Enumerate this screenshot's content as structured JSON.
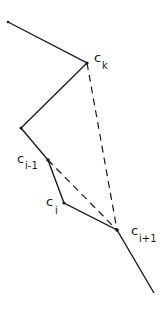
{
  "diagram": {
    "type": "polygonal-chain",
    "stroke_color": "#1a1a1a",
    "background": "#ffffff",
    "vertices": [
      {
        "id": "start",
        "x": 8,
        "y": 22,
        "label": ""
      },
      {
        "id": "ck",
        "x": 87,
        "y": 63,
        "label": "c",
        "subscript": "k"
      },
      {
        "id": "v",
        "x": 21,
        "y": 128,
        "label": ""
      },
      {
        "id": "ci-1",
        "x": 48,
        "y": 160,
        "label": "c",
        "subscript": "i-1"
      },
      {
        "id": "ci",
        "x": 64,
        "y": 203,
        "label": "c",
        "subscript": "i"
      },
      {
        "id": "ci+1",
        "x": 117,
        "y": 230,
        "label": "c",
        "subscript": "i+1"
      },
      {
        "id": "end",
        "x": 154,
        "y": 293,
        "label": ""
      }
    ],
    "solid_path": [
      "start",
      "ck",
      "v",
      "ci-1",
      "ci",
      "ci+1",
      "end"
    ],
    "dashed_segments": [
      {
        "from": "ck",
        "to": "ci+1"
      },
      {
        "from": "ci-1",
        "to": "ci+1"
      }
    ],
    "labels": {
      "ck": {
        "main": "c",
        "sub": "k"
      },
      "ci_minus_1": {
        "main": "c",
        "sub": "i-1"
      },
      "ci": {
        "main": "c",
        "sub": "i"
      },
      "ci_plus_1": {
        "main": "c",
        "sub": "i+1"
      }
    }
  }
}
